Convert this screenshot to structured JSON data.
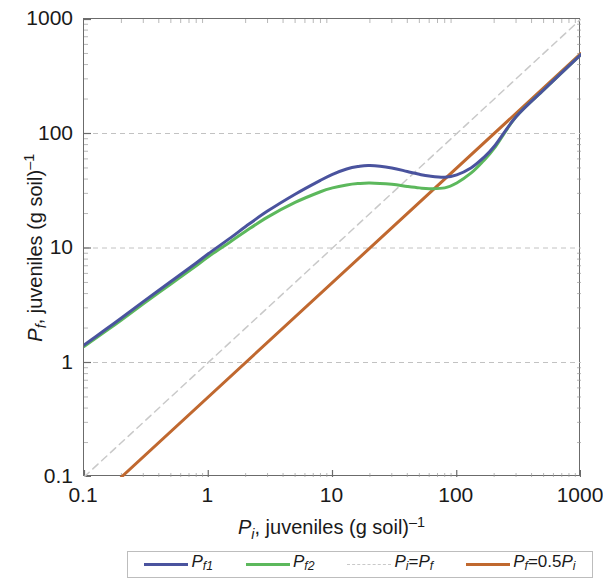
{
  "chart_data": {
    "type": "line",
    "title": "",
    "xlabel": "P_i, juveniles (g soil)^-1",
    "ylabel": "P_f, juveniles (g soil)^-1",
    "xscale": "log",
    "yscale": "log",
    "xlim": [
      0.1,
      1000
    ],
    "ylim": [
      0.1,
      1000
    ],
    "grid": "horizontal-dashed",
    "legend_position": "bottom",
    "xticks": [
      "0.1",
      "1",
      "10",
      "100",
      "1000"
    ],
    "xtick_values": [
      0.1,
      1,
      10,
      100,
      1000
    ],
    "yticks": [
      "0.1",
      "1",
      "10",
      "100",
      "1000"
    ],
    "ytick_values": [
      0.1,
      1,
      10,
      100,
      1000
    ],
    "series": [
      {
        "name": "Pf1",
        "color": "#4a539e",
        "style": "solid",
        "width": 3,
        "x": [
          0.1,
          0.15,
          0.2,
          0.3,
          0.5,
          0.8,
          1.0,
          1.5,
          2,
          3,
          5,
          8,
          10,
          13,
          16,
          20,
          30,
          40,
          50,
          60,
          80,
          100,
          130,
          160,
          200,
          300,
          500,
          700,
          1000
        ],
        "y": [
          1.42,
          1.95,
          2.45,
          3.4,
          5.1,
          7.4,
          8.9,
          12.2,
          15.4,
          21.0,
          29.5,
          39.0,
          44.0,
          49.0,
          51.5,
          52.5,
          50.0,
          46.5,
          44.0,
          42.5,
          41.5,
          43.5,
          50.0,
          60.0,
          77.0,
          140.0,
          240.0,
          340.0,
          490.0
        ]
      },
      {
        "name": "Pf2",
        "color": "#5cb85c",
        "style": "solid",
        "width": 3,
        "x": [
          0.1,
          0.15,
          0.2,
          0.3,
          0.5,
          0.8,
          1.0,
          1.5,
          2,
          3,
          5,
          8,
          10,
          13,
          16,
          20,
          30,
          40,
          50,
          60,
          80,
          100,
          130,
          160,
          200,
          300,
          500,
          700,
          1000
        ],
        "y": [
          1.38,
          1.88,
          2.35,
          3.25,
          4.85,
          7.0,
          8.4,
          11.3,
          14.0,
          18.6,
          25.0,
          31.0,
          33.5,
          35.5,
          36.5,
          37.0,
          36.0,
          34.5,
          33.5,
          33.0,
          33.5,
          37.0,
          45.0,
          56.0,
          74.0,
          140.0,
          240.0,
          340.0,
          490.0
        ]
      },
      {
        "name": "Pi=Pf",
        "color": "#c9c9c9",
        "style": "dashed",
        "width": 1.5,
        "x": [
          0.1,
          1000
        ],
        "y": [
          0.1,
          1000
        ]
      },
      {
        "name": "Pf=0.5Pi",
        "color": "#c0682f",
        "style": "solid",
        "width": 3,
        "x": [
          0.2,
          1000
        ],
        "y": [
          0.1,
          500
        ]
      }
    ]
  },
  "axes": {
    "x_title_parts": {
      "var": "P",
      "sub": "i",
      "text": ", juveniles (g soil)",
      "sup": "–1"
    },
    "y_title_parts": {
      "var": "P",
      "sub": "f",
      "text": ", juveniles (g soil)",
      "sup": "–1"
    },
    "xticks": [
      "0.1",
      "1",
      "10",
      "100",
      "1000"
    ],
    "yticks": [
      "0.1",
      "1",
      "10",
      "100",
      "1000"
    ]
  },
  "legend": {
    "items": [
      {
        "label_var": "P",
        "label_sub": "f1",
        "label_tail": "",
        "color": "#4a539e",
        "style": "solid"
      },
      {
        "label_var": "P",
        "label_sub": "f2",
        "label_tail": "",
        "color": "#5cb85c",
        "style": "solid"
      },
      {
        "label_var": "P",
        "label_sub": "i",
        "label_tail": "=P",
        "label_tail_sub": "f",
        "color": "#c9c9c9",
        "style": "dashed"
      },
      {
        "label_var": "P",
        "label_sub": "f",
        "label_tail": "=0.5P",
        "label_tail_sub": "i",
        "color": "#c0682f",
        "style": "solid"
      }
    ]
  },
  "colors": {
    "pf1": "#4a539e",
    "pf2": "#5cb85c",
    "identity": "#c9c9c9",
    "half": "#c0682f",
    "frame": "#6b6b6b",
    "grid": "#c2c2c2",
    "text": "#1a1a1a"
  }
}
